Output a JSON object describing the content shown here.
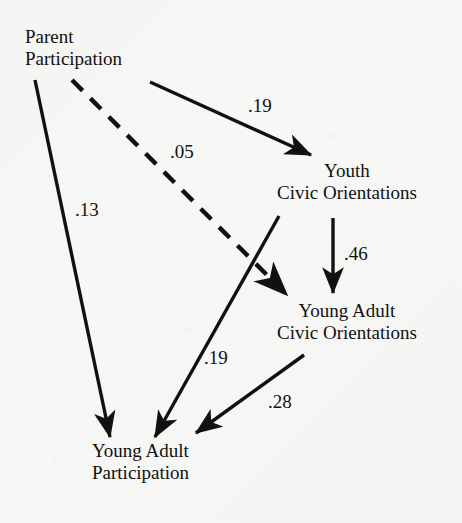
{
  "figure": {
    "type": "path-diagram",
    "background_color": "#f7f7f5",
    "ink_color": "#111111"
  },
  "nodes": [
    {
      "id": "parent-participation",
      "line1": "Parent",
      "line2": "Participation",
      "align": "left",
      "x": 25,
      "y": 26
    },
    {
      "id": "youth-civic-orientations",
      "line1": "Youth",
      "line2": "Civic Orientations",
      "align": "center",
      "x": 277,
      "y": 160
    },
    {
      "id": "young-adult-civic-orientations",
      "line1": "Young Adult",
      "line2": "Civic Orientations",
      "align": "center",
      "x": 277,
      "y": 300
    },
    {
      "id": "young-adult-participation",
      "line1": "Young Adult",
      "line2": "Participation",
      "align": "left",
      "x": 92,
      "y": 440
    }
  ],
  "edges": [
    {
      "id": "parent-to-youth-civic",
      "from": "parent-participation",
      "to": "youth-civic-orientations",
      "coefficient": ".19",
      "style": "solid",
      "x1": 150,
      "y1": 82,
      "x2": 311,
      "y2": 155,
      "label_x": 248,
      "label_y": 96
    },
    {
      "id": "parent-to-young-adult-civic",
      "from": "parent-participation",
      "to": "young-adult-civic-orientations",
      "coefficient": ".05",
      "style": "dashed",
      "x1": 72,
      "y1": 80,
      "x2": 287,
      "y2": 295,
      "label_x": 170,
      "label_y": 142
    },
    {
      "id": "parent-to-young-adult-participation",
      "from": "parent-participation",
      "to": "young-adult-participation",
      "coefficient": ".13",
      "style": "solid",
      "x1": 35,
      "y1": 80,
      "x2": 110,
      "y2": 437,
      "label_x": 75,
      "label_y": 200
    },
    {
      "id": "youth-civic-to-young-adult-civic",
      "from": "youth-civic-orientations",
      "to": "young-adult-civic-orientations",
      "coefficient": ".46",
      "style": "solid",
      "x1": 333,
      "y1": 218,
      "x2": 333,
      "y2": 293,
      "label_x": 344,
      "label_y": 244
    },
    {
      "id": "youth-civic-to-young-adult-participation",
      "from": "youth-civic-orientations",
      "to": "young-adult-participation",
      "coefficient": ".19",
      "style": "solid",
      "x1": 279,
      "y1": 216,
      "x2": 155,
      "y2": 437,
      "label_x": 204,
      "label_y": 348
    },
    {
      "id": "young-adult-civic-to-young-adult-participation",
      "from": "young-adult-civic-orientations",
      "to": "young-adult-participation",
      "coefficient": ".28",
      "style": "solid",
      "x1": 304,
      "y1": 355,
      "x2": 196,
      "y2": 433,
      "label_x": 268,
      "label_y": 392
    }
  ]
}
